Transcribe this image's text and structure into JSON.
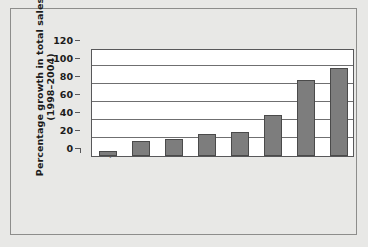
{
  "chart_data": {
    "type": "bar",
    "title": "",
    "xlabel": "",
    "ylabel_lines": [
      "Percentage growth  in total sales",
      "(1998–2004)"
    ],
    "ylabel": "Percentage growth in total sales (1998–2004)",
    "categories": [
      "Japan",
      "USA",
      "Morocco",
      "Thailand",
      "China",
      "Czech Republic",
      "South Africa",
      "Indonesia"
    ],
    "values": [
      6,
      17,
      19,
      24,
      27,
      46,
      84,
      98
    ],
    "yticks": [
      0,
      20,
      40,
      60,
      80,
      100,
      120
    ],
    "ytick_labels": [
      "0",
      "20",
      "40",
      "60",
      "80",
      "100",
      "120"
    ],
    "ylim": [
      0,
      120
    ],
    "grid": true,
    "legend": false,
    "bar_color": "#7d7d7d",
    "bar_edge_color": "#4a4a4a",
    "plot_background": "#ffffff",
    "figure_background": "#e8e8e6",
    "axis_color": "#58585a"
  }
}
